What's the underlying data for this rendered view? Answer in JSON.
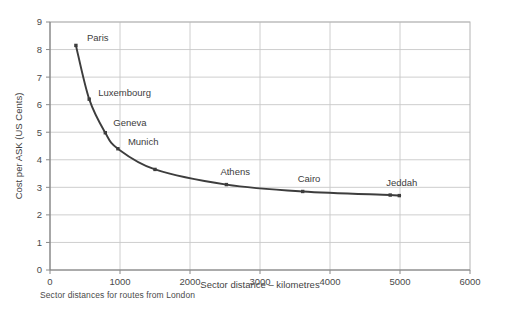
{
  "chart_data": {
    "type": "line",
    "title": "",
    "xlabel": "Sector distance – kilometres",
    "ylabel": "Cost per ASK (US Cents)",
    "xlim": [
      0,
      6000
    ],
    "ylim": [
      0,
      9
    ],
    "xticks": [
      0,
      1000,
      2000,
      3000,
      4000,
      5000,
      6000
    ],
    "xtick_labels": [
      "0",
      "1000",
      "2000",
      "3000",
      "4000",
      "5000",
      "6000"
    ],
    "yticks": [
      0,
      1,
      2,
      3,
      4,
      5,
      6,
      7,
      8,
      9
    ],
    "ytick_labels": [
      "0",
      "1",
      "2",
      "3",
      "4",
      "5",
      "6",
      "7",
      "8",
      "9"
    ],
    "grid": true,
    "grid_axis": "both",
    "legend": false,
    "legend_position": "none",
    "series": [
      {
        "name": "Cost per ASK",
        "x": [
          370,
          560,
          790,
          970,
          1500,
          2520,
          3610,
          4860,
          4990
        ],
        "y": [
          8.15,
          6.2,
          4.98,
          4.4,
          3.65,
          3.1,
          2.85,
          2.72,
          2.7
        ],
        "point_labels": [
          "Paris",
          "Luxembourg",
          "Geneva",
          "Munich",
          "",
          "Athens",
          "Cairo",
          "Jeddah",
          ""
        ],
        "color": "#3d3d3d",
        "marker": "square",
        "line_width": 1.9
      }
    ],
    "annotations": [
      {
        "text": "Paris",
        "x": 370,
        "y": 8.15,
        "dx": 11,
        "dy": -4
      },
      {
        "text": "Luxembourg",
        "x": 560,
        "y": 6.2,
        "dx": 9,
        "dy": -3
      },
      {
        "text": "Geneva",
        "x": 790,
        "y": 4.98,
        "dx": 8,
        "dy": -7
      },
      {
        "text": "Munich",
        "x": 970,
        "y": 4.4,
        "dx": 10,
        "dy": -4
      },
      {
        "text": "Athens",
        "x": 2520,
        "y": 3.1,
        "dx": -6,
        "dy": -10
      },
      {
        "text": "Cairo",
        "x": 3610,
        "y": 2.85,
        "dx": -5,
        "dy": -9
      },
      {
        "text": "Jeddah",
        "x": 4860,
        "y": 2.72,
        "dx": -4,
        "dy": -9
      }
    ]
  },
  "caption": {
    "text": "Sector distances for routes from London"
  },
  "colors": {
    "line": "#3d3d3d",
    "grid": "#c8c8c8",
    "axis": "#8a8a8a",
    "text": "#3f3f3f",
    "background": "#ffffff"
  }
}
